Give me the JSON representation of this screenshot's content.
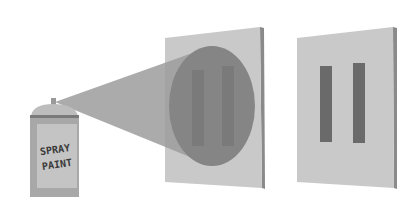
{
  "diagram": {
    "title": "",
    "can": {
      "label_line1": "SPRAY",
      "label_line2": "PAINT"
    },
    "colors": {
      "background": "#ffffff",
      "panel_face": "#c9c9c9",
      "panel_edge": "#8a8a8a",
      "spray_cone": "#9c9c9c",
      "spray_spot": "#7f7f7f",
      "slit": "#6a6a6a",
      "can_body": "#a8a8a8",
      "can_label": "#c4c4c4",
      "can_cap": "#bdbdbd"
    }
  }
}
